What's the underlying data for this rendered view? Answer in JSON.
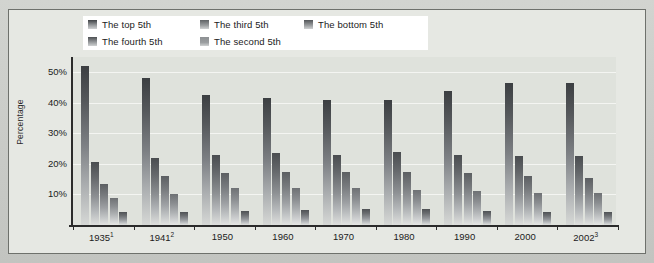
{
  "chart_data": {
    "type": "bar",
    "title": "",
    "xlabel": "",
    "ylabel": "Percentage",
    "ylim": [
      0,
      55
    ],
    "yticks": [
      10,
      20,
      30,
      40,
      50
    ],
    "ytick_labels": [
      "10%",
      "20%",
      "30%",
      "40%",
      "50%"
    ],
    "grid": true,
    "legend_position": "top",
    "categories": [
      "1935",
      "1941",
      "1950",
      "1960",
      "1970",
      "1980",
      "1990",
      "2000",
      "2002"
    ],
    "category_labels": [
      "1935¹",
      "1941²",
      "1950",
      "1960",
      "1970",
      "1980",
      "1990",
      "2000",
      "2002³"
    ],
    "category_footnotes": [
      "1",
      "2",
      "",
      "",
      "",
      "",
      "",
      "",
      "3"
    ],
    "series": [
      {
        "name": "The top 5th",
        "values": [
          52.0,
          48.0,
          42.5,
          41.5,
          40.9,
          41.0,
          44.0,
          46.5,
          46.5
        ]
      },
      {
        "name": "The fourth 5th",
        "values": [
          20.5,
          22.0,
          23.0,
          23.5,
          23.0,
          24.0,
          23.0,
          22.5,
          22.5
        ]
      },
      {
        "name": "The third 5th",
        "values": [
          13.5,
          16.0,
          17.0,
          17.5,
          17.5,
          17.5,
          17.0,
          16.0,
          15.5
        ]
      },
      {
        "name": "The second 5th",
        "values": [
          9.0,
          10.0,
          12.0,
          12.0,
          12.0,
          11.5,
          11.0,
          10.5,
          10.5
        ]
      },
      {
        "name": "The bottom 5th",
        "values": [
          4.1,
          4.1,
          4.5,
          4.8,
          5.4,
          5.1,
          4.6,
          4.2,
          4.2
        ]
      }
    ]
  },
  "legend": {
    "items": [
      {
        "label": "The top 5th",
        "swatch": "#3f4245"
      },
      {
        "label": "The third 5th",
        "swatch": "#5f6265"
      },
      {
        "label": "The bottom 5th",
        "swatch": "#525558"
      },
      {
        "label": "The fourth 5th",
        "swatch": "#4d5053"
      },
      {
        "label": "The second 5th",
        "swatch": "#8d9093"
      }
    ]
  },
  "axes": {
    "y_title": "Percentage",
    "y_labels": [
      "50%",
      "40%",
      "30%",
      "20%",
      "10%"
    ]
  },
  "colors": {
    "page_background": "#cfd1cd",
    "panel_background": "#e6e8e3",
    "plot_background": "#dfe2dc",
    "gridline": "#f4f5f2",
    "axis": "#2b2b2b",
    "legend_background": "#ffffff",
    "text": "#1b1b1b"
  }
}
